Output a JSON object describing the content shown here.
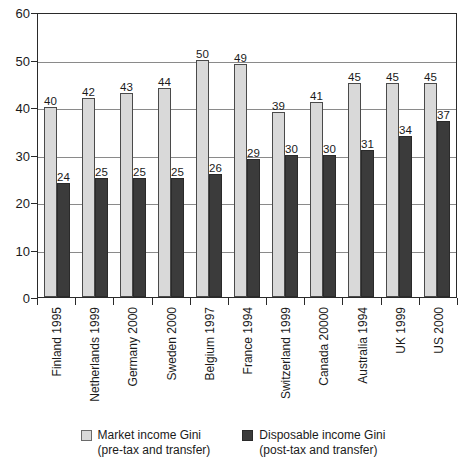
{
  "chart_data": {
    "type": "bar",
    "title": "",
    "xlabel": "",
    "ylabel": "",
    "ylim": [
      0,
      60
    ],
    "yticks": [
      0,
      10,
      20,
      30,
      40,
      50,
      60
    ],
    "grid": "horizontal",
    "legend_position": "bottom-center",
    "categories": [
      "Finland 1995",
      "Netherlands 1999",
      "Germany 2000",
      "Sweden 2000",
      "Belgium 1997",
      "France 1994",
      "Switzerland 1999",
      "Canada 20000",
      "Australia 1994",
      "UK 1999",
      "US 2000"
    ],
    "series": [
      {
        "name": "Market income Gini",
        "sublabel": "(pre-tax and transfer)",
        "color": "#d9d9d9",
        "values": [
          40,
          42,
          43,
          44,
          50,
          49,
          39,
          41,
          45,
          45,
          45
        ]
      },
      {
        "name": "Disposable income Gini",
        "sublabel": "(post-tax and transfer)",
        "color": "#3b3b3b",
        "values": [
          24,
          25,
          25,
          25,
          26,
          29,
          30,
          30,
          31,
          34,
          37
        ]
      }
    ]
  },
  "legend": {
    "items": [
      {
        "label": "Market income Gini",
        "sublabel": "(pre-tax and transfer)"
      },
      {
        "label": "Disposable income Gini",
        "sublabel": "(post-tax and transfer)"
      }
    ]
  }
}
